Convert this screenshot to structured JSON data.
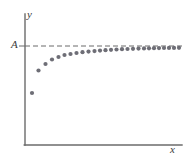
{
  "figure": {
    "name": "asymptotic-sequence-scatter",
    "background_color": "#ffffff",
    "width": 186,
    "height": 160
  },
  "labels": {
    "y_axis": "y",
    "x_axis": "x",
    "asymptote": "A"
  },
  "style": {
    "axis_color": "#6b6b6b",
    "dot_color": "#6e6e76",
    "dash_color": "#6b6b6b",
    "text_color": "#3b3b3b",
    "dot_radius": 2.1,
    "axis_width": 1.4,
    "dash_pattern": "5,3"
  },
  "geometry": {
    "y_axis_x": 25,
    "y_axis_top": 14,
    "x_axis_y": 145,
    "x_axis_right": 182,
    "asymptote_y": 46,
    "asymptote_x_start": 25,
    "asymptote_x_end": 182
  },
  "chart_data": {
    "type": "scatter",
    "title": "",
    "xlabel": "x",
    "ylabel": "y",
    "grid": false,
    "legend": null,
    "annotations": [
      {
        "text": "A",
        "type": "asymptote-level-label",
        "y_pixel": 46
      },
      {
        "text": "dashed horizontal asymptote y = A",
        "type": "reference-line"
      }
    ],
    "xlim": [
      25,
      182
    ],
    "ylim": [
      145,
      14
    ],
    "asymptote_value_label": "A",
    "points_pixel": [
      {
        "x": 32,
        "y": 93
      },
      {
        "x": 38.5,
        "y": 70.5
      },
      {
        "x": 45.5,
        "y": 64
      },
      {
        "x": 52,
        "y": 59.5
      },
      {
        "x": 58.5,
        "y": 57
      },
      {
        "x": 64.5,
        "y": 55
      },
      {
        "x": 70.5,
        "y": 54
      },
      {
        "x": 76.5,
        "y": 53
      },
      {
        "x": 82.5,
        "y": 52.2
      },
      {
        "x": 88.5,
        "y": 51.6
      },
      {
        "x": 94.5,
        "y": 51.1
      },
      {
        "x": 100,
        "y": 50.6
      },
      {
        "x": 105.5,
        "y": 50.2
      },
      {
        "x": 111,
        "y": 49.8
      },
      {
        "x": 116.5,
        "y": 49.5
      },
      {
        "x": 122,
        "y": 49.2
      },
      {
        "x": 127.5,
        "y": 49
      },
      {
        "x": 133,
        "y": 48.8
      },
      {
        "x": 138.5,
        "y": 48.6
      },
      {
        "x": 144,
        "y": 48.4
      },
      {
        "x": 149,
        "y": 48.3
      },
      {
        "x": 154,
        "y": 48.2
      },
      {
        "x": 159,
        "y": 48.1
      },
      {
        "x": 164,
        "y": 48
      },
      {
        "x": 169,
        "y": 47.9
      },
      {
        "x": 174,
        "y": 47.9
      },
      {
        "x": 179,
        "y": 47.8
      }
    ],
    "point_count": 27
  }
}
